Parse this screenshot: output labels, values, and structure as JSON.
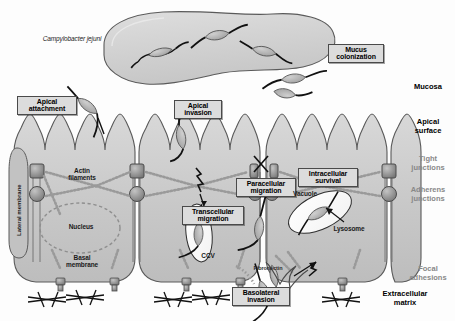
{
  "figure": {
    "organism": "Campylobacter jejuni",
    "callouts": {
      "mucus_colonization": "Mucus\ncolonization",
      "apical_attachment": "Apical\nattachment",
      "apical_invasion": "Apical\ninvasion",
      "paracellular_migration": "Paracellular\nmigration",
      "transcellular_migration": "Transcellular\nmigration",
      "intracellular_survival": "Intracellular\nsurvival",
      "basolateral_invasion": "Basolateral\ninvasion"
    },
    "internal_labels": {
      "actin_filaments": "Actin\nfilaments",
      "nucleus": "Nucleus",
      "basal_membrane": "Basal\nmembrane",
      "lateral_membrane": "Lateral membrane",
      "vacuole": "Vacuole",
      "lysosome": "Lysosome",
      "ccv": "CCV",
      "fibronectin": "Fibronectin"
    },
    "legend": [
      {
        "label": "Mucosa",
        "tone": "dark"
      },
      {
        "label": "Apical\nsurface",
        "tone": "dark"
      },
      {
        "label": "Tight\njunctions",
        "tone": "grey"
      },
      {
        "label": "Adherens\njunctions",
        "tone": "grey"
      },
      {
        "label": "Focal\nadhesions",
        "tone": "grey"
      },
      {
        "label": "Extracellular\nmatrix",
        "tone": "dark"
      }
    ],
    "colors": {
      "cell_fill": "#c9c9c9",
      "mucus_fill": "#d4d4d4",
      "bacteria_fill": "#b0b0b0",
      "flagella": "#111111",
      "junction": "#8a8a8a",
      "callout_bg": "#dcdcdc",
      "callout_border": "#4a4a4a",
      "outline": "#5a5a5a"
    }
  }
}
